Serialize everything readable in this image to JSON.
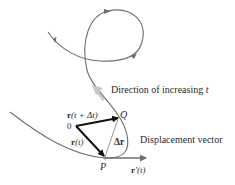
{
  "diagram": {
    "labels": {
      "direction": "Direction of increasing ",
      "direction_var": "t",
      "displacement": "Displacement vector",
      "origin": "0",
      "point_p": "P",
      "point_q": "Q",
      "r_t_bold": "r",
      "r_t_rest": "(t)",
      "r_tdt_bold": "r",
      "r_tdt_rest": "(t + Δt)",
      "delta_r": "Δr",
      "r_prime_bold": "r",
      "r_prime_rest": "′(t)"
    },
    "colors": {
      "curve": "#6e6e6e",
      "vector": "#111111",
      "delta": "#9a9a9a",
      "direction_arrow": "#c8c8c8",
      "text": "#2a2a2a"
    }
  }
}
